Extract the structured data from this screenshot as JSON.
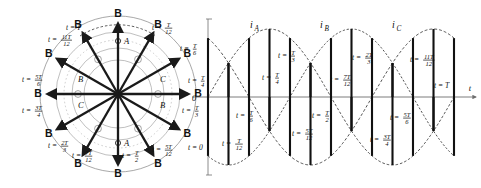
{
  "figure": {
    "type": "technical-diagram"
  },
  "vector_diagram": {
    "center": {
      "x": 118,
      "y": 94
    },
    "flux_label": "B",
    "stator_slot_labels": [
      {
        "text": "A",
        "x": 124,
        "y": 44
      },
      {
        "text": "A",
        "x": 124,
        "y": 146
      },
      {
        "text": "B",
        "x": 78,
        "y": 82
      },
      {
        "text": "B",
        "x": 160,
        "y": 108
      },
      {
        "text": "C",
        "x": 160,
        "y": 82
      },
      {
        "text": "C",
        "x": 78,
        "y": 108
      }
    ],
    "vectors": [
      {
        "index": 0,
        "angle_deg": 90,
        "time": {
          "num": "",
          "den": "",
          "whole": "T"
        },
        "label_tex": "t = T",
        "label_x": 66,
        "label_y": 30,
        "tip_label_x": 100,
        "tip_label_y": 16
      },
      {
        "index": 1,
        "angle_deg": 60,
        "time": {
          "num": "T",
          "den": "12"
        },
        "label_tex": "t = T/12",
        "label_x": 152,
        "label_y": 30,
        "tip_label_x": 146,
        "tip_label_y": 27
      },
      {
        "index": 2,
        "angle_deg": 30,
        "time": {
          "num": "T",
          "den": "6"
        },
        "label_tex": "t = T/6",
        "label_x": 180,
        "label_y": 51,
        "tip_label_x": 172,
        "tip_label_y": 57
      },
      {
        "index": 3,
        "angle_deg": 0,
        "time": {
          "num": "T",
          "den": "4"
        },
        "label_tex": "t = T/4",
        "label_x": 188,
        "label_y": 83,
        "tip_label_x": 178,
        "tip_label_y": 95
      },
      {
        "index": 4,
        "angle_deg": -30,
        "time": {
          "num": "T",
          "den": "3"
        },
        "label_tex": "t = T/3",
        "label_x": 182,
        "label_y": 113,
        "tip_label_x": 172,
        "tip_label_y": 130
      },
      {
        "index": 5,
        "angle_deg": -60,
        "time": {
          "num": "5T",
          "den": "12"
        },
        "label_tex": "t = 5/12 T",
        "label_x": 152,
        "label_y": 152,
        "tip_label_x": 146,
        "tip_label_y": 163
      },
      {
        "index": 6,
        "angle_deg": -90,
        "time": {
          "num": "T",
          "den": "2"
        },
        "label_tex": "t = T/2",
        "label_x": 122,
        "label_y": 158,
        "tip_label_x": 118,
        "tip_label_y": 176
      },
      {
        "index": 7,
        "angle_deg": -120,
        "time": {
          "num": "7T",
          "den": "12"
        },
        "label_tex": "t = 7/12 T",
        "label_x": 72,
        "label_y": 158,
        "tip_label_x": 88,
        "tip_label_y": 163
      },
      {
        "index": 8,
        "angle_deg": -150,
        "time": {
          "num": "2T",
          "den": "3"
        },
        "label_tex": "t = 2/3 T",
        "label_x": 48,
        "label_y": 148,
        "tip_label_x": 62,
        "tip_label_y": 130
      },
      {
        "index": 9,
        "angle_deg": 180,
        "time": {
          "num": "3T",
          "den": "4"
        },
        "label_tex": "t = 3/4 T",
        "label_x": 22,
        "label_y": 113,
        "tip_label_x": 56,
        "tip_label_y": 95
      },
      {
        "index": 10,
        "angle_deg": 150,
        "time": {
          "num": "5T",
          "den": "6"
        },
        "label_tex": "t = 5/6 T",
        "label_x": 22,
        "label_y": 82,
        "tip_label_x": 62,
        "tip_label_y": 57
      },
      {
        "index": 11,
        "angle_deg": 120,
        "time": {
          "num": "11T",
          "den": "12"
        },
        "label_tex": "t = 11/12 T",
        "label_x": 48,
        "label_y": 42,
        "tip_label_x": 88,
        "tip_label_y": 27
      }
    ]
  },
  "chart_data": {
    "type": "line",
    "title": "",
    "xlabel": "t",
    "ylabel": "",
    "grid": false,
    "legend_position": "inline-above-curves",
    "x": [
      0,
      0.0833,
      0.1667,
      0.25,
      0.3333,
      0.4167,
      0.5,
      0.5833,
      0.6667,
      0.75,
      0.8333,
      0.9167,
      1.0
    ],
    "x_tick_labels": [
      "t = 0",
      "t = T/12",
      "t = T/6",
      "t = T/4",
      "t = T/3",
      "t = 5/12 T",
      "t = T/2",
      "t = 7/12 T",
      "t = 2/3 T",
      "t = 3/4 T",
      "t = 5/6 T",
      "t = 11/12 T",
      "t = T"
    ],
    "axis_origin_label": "0",
    "ylim": [
      -1,
      1
    ],
    "xlim": [
      0,
      1
    ],
    "series": [
      {
        "name": "iA",
        "phase_deg": 0,
        "amplitude": 1,
        "values": [
          0,
          0.5,
          0.866,
          1.0,
          0.866,
          0.5,
          0,
          -0.5,
          -0.866,
          -1.0,
          -0.866,
          -0.5,
          0
        ]
      },
      {
        "name": "iB",
        "phase_deg": -120,
        "amplitude": 1,
        "values": [
          -0.866,
          -1.0,
          -0.866,
          -0.5,
          0,
          0.5,
          0.866,
          1.0,
          0.866,
          0.5,
          0,
          -0.5,
          -0.866
        ]
      },
      {
        "name": "iC",
        "phase_deg": 120,
        "amplitude": 1,
        "values": [
          0.866,
          0.5,
          0,
          -0.5,
          -0.866,
          -1.0,
          -0.866,
          -0.5,
          0,
          0.5,
          0.866,
          1.0,
          0.866
        ]
      }
    ],
    "series_labels": [
      {
        "name": "iA",
        "base": "i",
        "sub": "A",
        "x": 250,
        "y": 28
      },
      {
        "name": "iB",
        "base": "i",
        "sub": "B",
        "x": 320,
        "y": 28
      },
      {
        "name": "iC",
        "base": "i",
        "sub": "C",
        "x": 392,
        "y": 28
      }
    ],
    "annotations": [
      {
        "text": "t = 0",
        "x": 188,
        "y": 150
      },
      {
        "text": "t = T/12",
        "x": 222,
        "y": 146
      },
      {
        "text": "t = T/6",
        "x": 236,
        "y": 118
      },
      {
        "text": "t = T/4",
        "x": 262,
        "y": 80
      },
      {
        "text": "t = T/3",
        "x": 278,
        "y": 58
      },
      {
        "text": "t = 5/12 T",
        "x": 292,
        "y": 136
      },
      {
        "text": "t = T/2",
        "x": 312,
        "y": 118
      },
      {
        "text": "t = 7/12 T",
        "x": 330,
        "y": 82
      },
      {
        "text": "t = 2/3 T",
        "x": 352,
        "y": 60
      },
      {
        "text": "t = 3/4 T",
        "x": 370,
        "y": 142
      },
      {
        "text": "t = 5/6 T",
        "x": 390,
        "y": 120
      },
      {
        "text": "t = 11/12 T",
        "x": 410,
        "y": 62
      },
      {
        "text": "t = T",
        "x": 434,
        "y": 88
      }
    ]
  },
  "colors": {
    "ink": "#111111",
    "vector": "#1a1a1a",
    "stator": "#8c8c8c",
    "axis": "#6e6e6e",
    "dashed": "#333333",
    "background": "#ffffff"
  }
}
